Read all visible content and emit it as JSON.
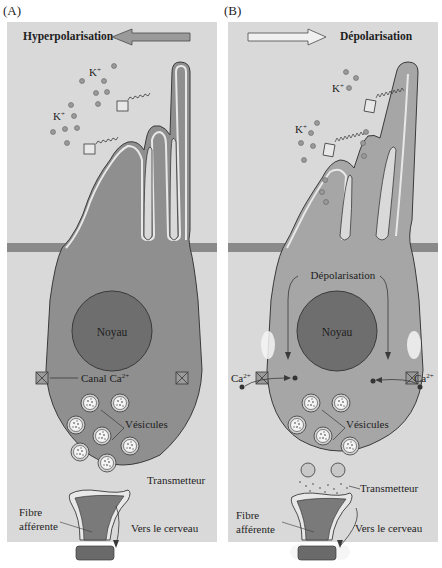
{
  "panels": [
    {
      "id": "A",
      "label": "(A)",
      "state_title": "Hyperpolarisation",
      "arrow_direction": "left",
      "ion_labels": [
        "K+",
        "K+"
      ],
      "nucleus_label": "Noyau",
      "channel_label": "Canal Ca2+",
      "vesicles_label": "Vésicules",
      "transmitter_label": "Transmetteur",
      "fiber_label_line1": "Fibre",
      "fiber_label_line2": "afférente",
      "brain_label": "Vers le cerveau"
    },
    {
      "id": "B",
      "label": "(B)",
      "state_title": "Dépolarisation",
      "arrow_direction": "right",
      "ion_labels": [
        "K+",
        "K+"
      ],
      "depolarisation_label": "Dépolarisation",
      "nucleus_label": "Noyau",
      "calcium_label_left": "Ca2+",
      "calcium_label_right": "Ca2+",
      "vesicles_label": "Vésicules",
      "transmitter_label": "Transmetteur",
      "fiber_label_line1": "Fibre",
      "fiber_label_line2": "afférente",
      "brain_label": "Vers le cerveau"
    }
  ],
  "text": {
    "k": "K",
    "plus": "+",
    "ca": "Ca",
    "two_plus": "2+",
    "canal": "Canal Ca"
  },
  "colors": {
    "background": "#d9d9d9",
    "cell_fill_a": "#8f8f8f",
    "cell_fill_b": "#a6a6a6",
    "membrane": "#e8e8e8",
    "outline": "#3a3a3a",
    "nucleus": "#6e6e6e",
    "band": "#8a8a8a",
    "ion": "#9a9a9a"
  }
}
